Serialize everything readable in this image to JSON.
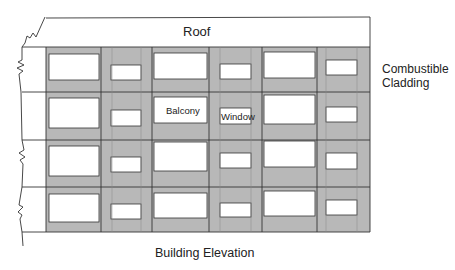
{
  "labels": {
    "roof": "Roof",
    "cladding": "Combustible\nCladding",
    "elevation": "Building Elevation",
    "balcony": "Balcony",
    "window": "Window"
  },
  "colors": {
    "cladding_fill": "#b8b8b8",
    "opening_fill": "#ffffff",
    "line": "#333333"
  },
  "facade": {
    "x": 46,
    "y": 47,
    "right": 370,
    "bottom": 232,
    "roof_top_left": 18,
    "roof_top_right": 17,
    "floor_lines": [
      47,
      92,
      140,
      187,
      232
    ],
    "floor_line_left": 22,
    "column_lines": [
      101,
      152,
      209,
      262,
      317
    ],
    "strip_lines": [
      112,
      141,
      220,
      251,
      326,
      357
    ],
    "floors": [
      {
        "big": [
          [
            49,
            54,
            99,
            80
          ],
          [
            154,
            53,
            207,
            79
          ],
          [
            264,
            52,
            315,
            78
          ]
        ],
        "small": [
          [
            111,
            65,
            141,
            80
          ],
          [
            220,
            64,
            251,
            79
          ],
          [
            326,
            60,
            357,
            75
          ]
        ]
      },
      {
        "big": [
          [
            49,
            98,
            99,
            128
          ],
          [
            154,
            97,
            207,
            123
          ],
          [
            264,
            95,
            315,
            124
          ]
        ],
        "small": [
          [
            111,
            110,
            141,
            126
          ],
          [
            220,
            108,
            251,
            124
          ],
          [
            326,
            107,
            357,
            122
          ]
        ]
      },
      {
        "big": [
          [
            49,
            146,
            99,
            176
          ],
          [
            154,
            142,
            207,
            171
          ],
          [
            264,
            141,
            315,
            167
          ]
        ],
        "small": [
          [
            111,
            157,
            141,
            172
          ],
          [
            220,
            153,
            251,
            168
          ],
          [
            326,
            153,
            357,
            169
          ]
        ]
      },
      {
        "big": [
          [
            49,
            194,
            99,
            222
          ],
          [
            154,
            193,
            207,
            218
          ],
          [
            264,
            191,
            315,
            216
          ]
        ],
        "small": [
          [
            111,
            204,
            141,
            219
          ],
          [
            220,
            203,
            251,
            217
          ],
          [
            326,
            200,
            357,
            215
          ]
        ]
      }
    ]
  }
}
